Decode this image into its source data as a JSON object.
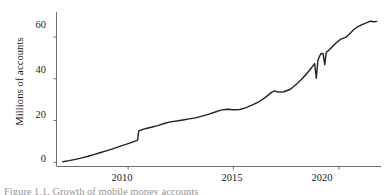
{
  "figure": {
    "caption_partial": "Figure 1.1. Growth of mobile money accounts"
  },
  "chart_data": {
    "type": "line",
    "title": "",
    "subtitle": "",
    "xlabel": "",
    "ylabel": "Millions of accounts",
    "xlim": [
      2006.6,
      2022.0
    ],
    "ylim": [
      -2,
      72
    ],
    "xticks": [
      2010,
      2015,
      2020
    ],
    "xticklabels": [
      "2010",
      "2015",
      "2020"
    ],
    "yticks": [
      0,
      20,
      40,
      60
    ],
    "yticklabels": [
      "0",
      "20",
      "40",
      "60"
    ],
    "grid": false,
    "legend": false,
    "legend_position": "none",
    "line_color": "#222222",
    "line_width": 1.4,
    "axis_color": "#6e6e6e",
    "series": [
      {
        "name": "Accounts",
        "x": [
          2006.9,
          2007.2,
          2007.5,
          2007.8,
          2008.1,
          2008.4,
          2008.7,
          2009.0,
          2009.3,
          2009.6,
          2009.9,
          2010.2,
          2010.45,
          2010.5,
          2010.7,
          2010.9,
          2011.1,
          2011.4,
          2011.7,
          2012.0,
          2012.3,
          2012.6,
          2012.9,
          2013.2,
          2013.5,
          2013.8,
          2014.1,
          2014.4,
          2014.7,
          2015.0,
          2015.3,
          2015.6,
          2015.9,
          2016.2,
          2016.5,
          2016.8,
          2016.95,
          2017.1,
          2017.4,
          2017.7,
          2018.0,
          2018.3,
          2018.6,
          2018.85,
          2018.93,
          2019.0,
          2019.07,
          2019.15,
          2019.25,
          2019.33,
          2019.4,
          2019.5,
          2019.7,
          2019.9,
          2020.1,
          2020.35,
          2020.5,
          2020.7,
          2020.9,
          2021.1,
          2021.3,
          2021.5,
          2021.65,
          2021.8
        ],
        "y": [
          0.3,
          0.8,
          1.4,
          2.1,
          2.9,
          3.8,
          4.7,
          5.6,
          6.6,
          7.6,
          8.6,
          9.7,
          10.6,
          15.0,
          15.8,
          16.3,
          16.8,
          17.6,
          18.6,
          19.4,
          19.8,
          20.3,
          20.8,
          21.3,
          22.1,
          23.0,
          24.0,
          25.0,
          25.4,
          25.2,
          25.3,
          26.2,
          27.5,
          29.0,
          31.0,
          33.5,
          34.2,
          33.6,
          33.8,
          35.0,
          37.5,
          40.5,
          44.0,
          47.3,
          40.3,
          48.5,
          50.5,
          52.0,
          52.2,
          46.8,
          52.6,
          53.5,
          55.5,
          57.5,
          59.0,
          60.0,
          61.5,
          63.5,
          65.0,
          66.0,
          66.8,
          67.6,
          67.3,
          67.5
        ]
      }
    ]
  }
}
